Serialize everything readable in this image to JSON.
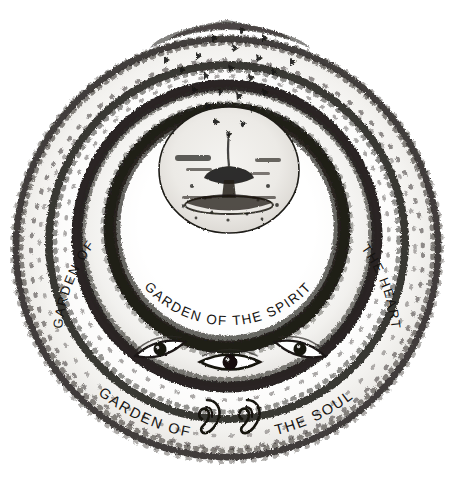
{
  "image": {
    "title": "Garden of the Soul, Heart and Spirit",
    "medium": "ink and brush drawing",
    "background_color": "#ffffff",
    "ink_color": "#161412"
  },
  "rings": [
    {
      "id": "spirit",
      "label": "GARDEN OF THE SPIRIT",
      "label_words": [
        "GARDEN",
        "OF",
        "THE",
        "SPIRIT"
      ],
      "position": "inner"
    },
    {
      "id": "heart",
      "label": "GARDEN OF THE HEART",
      "label_left": "GARDEN OF",
      "label_right": "THE HEART",
      "position": "middle"
    },
    {
      "id": "soul",
      "label": "GARDEN OF THE SOUL",
      "label_left": "GARDEN OF",
      "label_right": "THE SOUL",
      "position": "outer"
    }
  ],
  "motifs": {
    "center": {
      "name": "fountain",
      "description": "fountain or chalice at the centre of the innermost circle"
    },
    "eyes": {
      "name": "eyes",
      "count": 3,
      "description": "three eyes in the band between the heart and soul gardens"
    },
    "ears": {
      "name": "ears",
      "count": 2,
      "description": "a pair of ears within the soul garden band"
    },
    "hedges": {
      "name": "hedges",
      "description": "concentric hedgerows drawn with short dark brush strokes"
    }
  }
}
